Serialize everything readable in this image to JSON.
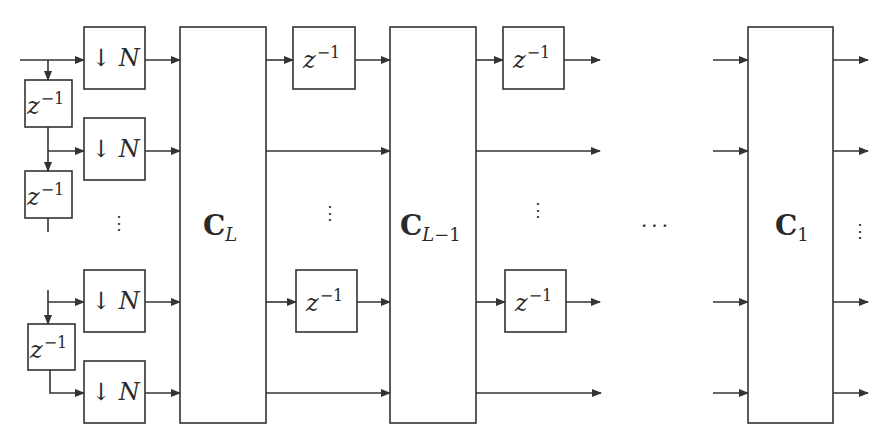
{
  "diagram": {
    "type": "polyphase filter bank block diagram",
    "colors": {
      "stroke": "#333333",
      "background": "#ffffff"
    },
    "decimators": [
      {
        "label_arrow": "↓",
        "label_var": "N"
      },
      {
        "label_arrow": "↓",
        "label_var": "N"
      },
      {
        "label_arrow": "↓",
        "label_var": "N"
      },
      {
        "label_arrow": "↓",
        "label_var": "N"
      }
    ],
    "delays_left": [
      {
        "base": "z",
        "exp": "−1"
      },
      {
        "base": "z",
        "exp": "−1"
      },
      {
        "base": "z",
        "exp": "−1"
      }
    ],
    "delays_stage1": [
      {
        "base": "z",
        "exp": "−1"
      },
      {
        "base": "z",
        "exp": "−1"
      }
    ],
    "delays_stage2": [
      {
        "base": "z",
        "exp": "−1"
      },
      {
        "base": "z",
        "exp": "−1"
      }
    ],
    "blocks": [
      {
        "name": "C",
        "sub": "L",
        "sub_suffix": ""
      },
      {
        "name": "C",
        "sub": "L",
        "sub_suffix": "−1"
      },
      {
        "name": "C",
        "sub": "",
        "sub_suffix": "1"
      }
    ],
    "ellipsis_vertical": "⋮",
    "ellipsis_horizontal": "···"
  }
}
